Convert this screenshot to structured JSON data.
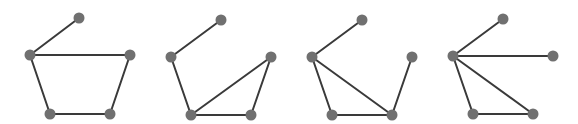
{
  "style": {
    "edge_color": "#3a3a3a",
    "node_color": "#707070",
    "node_radius": 5.5,
    "edge_width": 2
  },
  "graphs": [
    {
      "id": "graph-1",
      "nodes": [
        {
          "id": "top",
          "x": 79,
          "y": 18
        },
        {
          "id": "left",
          "x": 30,
          "y": 55
        },
        {
          "id": "right",
          "x": 130,
          "y": 55
        },
        {
          "id": "bottom-left",
          "x": 50,
          "y": 114
        },
        {
          "id": "bottom-right",
          "x": 110,
          "y": 114
        }
      ],
      "edges": [
        [
          "top",
          "left"
        ],
        [
          "left",
          "right"
        ],
        [
          "left",
          "bottom-left"
        ],
        [
          "bottom-left",
          "bottom-right"
        ],
        [
          "bottom-right",
          "right"
        ]
      ]
    },
    {
      "id": "graph-2",
      "nodes": [
        {
          "id": "top",
          "x": 221,
          "y": 20
        },
        {
          "id": "left",
          "x": 171,
          "y": 57
        },
        {
          "id": "right",
          "x": 271,
          "y": 57
        },
        {
          "id": "bottom-left",
          "x": 191,
          "y": 115
        },
        {
          "id": "bottom-right",
          "x": 251,
          "y": 115
        }
      ],
      "edges": [
        [
          "top",
          "left"
        ],
        [
          "left",
          "bottom-left"
        ],
        [
          "bottom-left",
          "right"
        ],
        [
          "bottom-left",
          "bottom-right"
        ],
        [
          "bottom-right",
          "right"
        ]
      ]
    },
    {
      "id": "graph-3",
      "nodes": [
        {
          "id": "top",
          "x": 362,
          "y": 20
        },
        {
          "id": "left",
          "x": 312,
          "y": 57
        },
        {
          "id": "right",
          "x": 412,
          "y": 57
        },
        {
          "id": "bottom-left",
          "x": 332,
          "y": 115
        },
        {
          "id": "bottom-right",
          "x": 392,
          "y": 115
        }
      ],
      "edges": [
        [
          "top",
          "left"
        ],
        [
          "left",
          "bottom-left"
        ],
        [
          "left",
          "bottom-right"
        ],
        [
          "bottom-left",
          "bottom-right"
        ],
        [
          "bottom-right",
          "right"
        ]
      ]
    },
    {
      "id": "graph-4",
      "nodes": [
        {
          "id": "top",
          "x": 503,
          "y": 19
        },
        {
          "id": "left",
          "x": 453,
          "y": 56
        },
        {
          "id": "right",
          "x": 553,
          "y": 56
        },
        {
          "id": "bottom-left",
          "x": 473,
          "y": 114
        },
        {
          "id": "bottom-right",
          "x": 533,
          "y": 114
        }
      ],
      "edges": [
        [
          "top",
          "left"
        ],
        [
          "left",
          "right"
        ],
        [
          "left",
          "bottom-left"
        ],
        [
          "left",
          "bottom-right"
        ],
        [
          "bottom-left",
          "bottom-right"
        ]
      ]
    }
  ]
}
